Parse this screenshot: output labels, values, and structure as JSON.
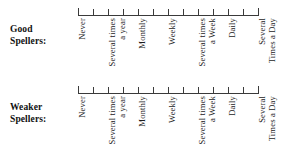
{
  "figure": {
    "background_color": "#ffffff",
    "line_color": "#3a3a3a",
    "text_color": "#1c1c1c"
  },
  "rows": [
    {
      "id": "good",
      "caption_line1": "Good",
      "caption_line2": "Spellers:",
      "tick_count": 13,
      "labels": [
        {
          "lines": [
            "Never"
          ]
        },
        {
          "lines": [
            "Several times",
            "a year"
          ]
        },
        {
          "lines": [
            "Monthly"
          ]
        },
        {
          "lines": [
            "Weekly"
          ]
        },
        {
          "lines": [
            "Several times",
            "a Week"
          ]
        },
        {
          "lines": [
            "Daily"
          ]
        },
        {
          "lines": [
            "Several",
            "Times a Day"
          ]
        }
      ]
    },
    {
      "id": "weaker",
      "caption_line1": "Weaker",
      "caption_line2": "Spellers:",
      "tick_count": 13,
      "labels": [
        {
          "lines": [
            "Never"
          ]
        },
        {
          "lines": [
            "Several times",
            "a year"
          ]
        },
        {
          "lines": [
            "Monthly"
          ]
        },
        {
          "lines": [
            "Weekly"
          ]
        },
        {
          "lines": [
            "Several times",
            "a Week"
          ]
        },
        {
          "lines": [
            "Daily"
          ]
        },
        {
          "lines": [
            "Several",
            "Times a Day"
          ]
        }
      ]
    }
  ]
}
